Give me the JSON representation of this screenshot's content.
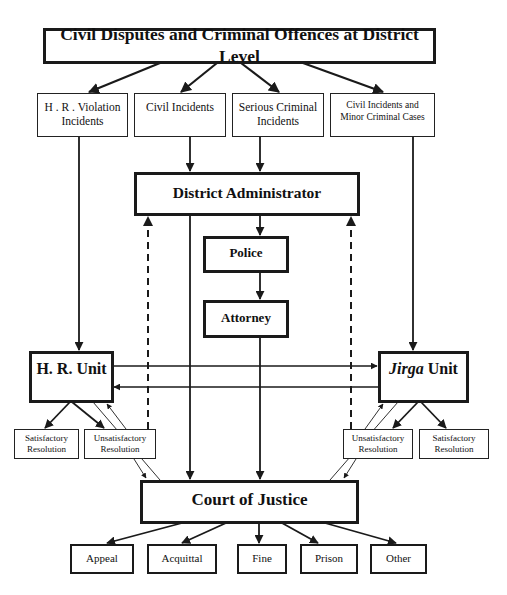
{
  "diagram": {
    "title": "Civil Disputes and Criminal Offences at District Level",
    "categories": [
      {
        "id": "hr-violation",
        "line1": "H . R . Violation",
        "line2": "Incidents"
      },
      {
        "id": "civil",
        "line1": "Civil Incidents",
        "line2": ""
      },
      {
        "id": "serious-criminal",
        "line1": "Serious Criminal",
        "line2": "Incidents"
      },
      {
        "id": "civil-minor",
        "line1": "Civil Incidents and",
        "line2": "Minor Criminal Cases"
      }
    ],
    "district_administrator": "District Administrator",
    "police": "Police",
    "attorney": "Attorney",
    "hr_unit": "H. R. Unit",
    "jirga_unit": {
      "italic": "Jirga",
      "rest": " Unit"
    },
    "resolutions": {
      "left_satisfactory": {
        "line1": "Satisfactory",
        "line2": "Resolution"
      },
      "left_unsatisfactory": {
        "line1": "Unsatisfactory",
        "line2": "Resolution"
      },
      "right_unsatisfactory": {
        "line1": "Unsatisfactory",
        "line2": "Resolution"
      },
      "right_satisfactory": {
        "line1": "Satisfactory",
        "line2": "Resolution"
      }
    },
    "court": "Court of Justice",
    "outcomes": [
      "Appeal",
      "Acquittal",
      "Fine",
      "Prison",
      "Other"
    ],
    "colors": {
      "line": "#1a1a1a",
      "background": "#ffffff"
    }
  }
}
